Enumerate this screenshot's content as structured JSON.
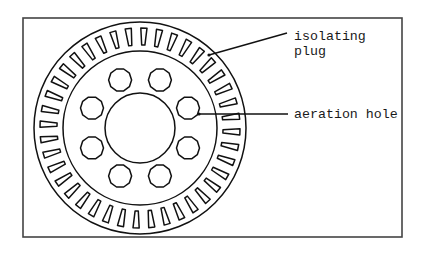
{
  "figure": {
    "frame": {
      "x": 23,
      "y": 18,
      "width": 379,
      "height": 219,
      "stroke": "#444444"
    },
    "wheel": {
      "center": [
        140,
        128
      ],
      "outer_radius": 106,
      "middle_radius": 77,
      "inner_radius": 35,
      "stroke": "#111111",
      "plugs": {
        "count": 40,
        "r_inner": 83,
        "r_outer": 100,
        "w_inner": 3.2,
        "w_outer": 6.2
      },
      "holes": {
        "count": 8,
        "ring_radius": 52,
        "radius": 11.5,
        "start_angle_deg": 22.5
      }
    },
    "labels": {
      "plug": {
        "line1": "isolating",
        "line2": "plug"
      },
      "aeration": "aeration hole"
    },
    "leaders": {
      "plug": {
        "x1": 209,
        "y1": 55,
        "x2": 287,
        "y2": 33
      },
      "aeration": {
        "x1": 199,
        "y1": 114,
        "x2": 288,
        "y2": 114
      }
    }
  }
}
